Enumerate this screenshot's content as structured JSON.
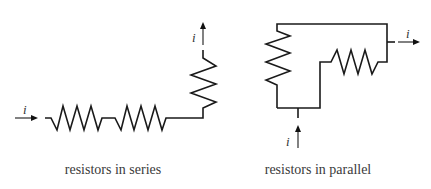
{
  "diagram": {
    "series": {
      "caption": "resistors in series",
      "input_current_label": "i",
      "output_current_label": "i",
      "resistor_count": 3
    },
    "parallel": {
      "caption": "resistors in parallel",
      "input_current_label": "i",
      "output_current_label": "i",
      "resistor_count": 2
    },
    "colors": {
      "stroke": "#1a1a1a",
      "text": "#3a3a3a",
      "background": "#ffffff"
    }
  }
}
